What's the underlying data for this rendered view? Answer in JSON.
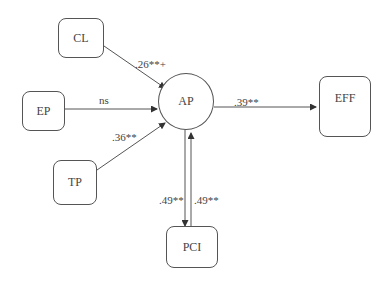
{
  "diagram": {
    "type": "path-model",
    "nodes": [
      {
        "id": "CL",
        "label": "CL",
        "shape": "rounded-rect"
      },
      {
        "id": "EP",
        "label": "EP",
        "shape": "rounded-rect"
      },
      {
        "id": "TP",
        "label": "TP",
        "shape": "rounded-rect"
      },
      {
        "id": "AP",
        "label": "AP",
        "shape": "circle"
      },
      {
        "id": "EFF",
        "label": "EFF",
        "shape": "rounded-rect"
      },
      {
        "id": "PCI",
        "label": "PCI",
        "shape": "rounded-rect"
      }
    ],
    "edges": [
      {
        "from": "CL",
        "to": "AP",
        "label": ".26**+"
      },
      {
        "from": "EP",
        "to": "AP",
        "label": "ns"
      },
      {
        "from": "TP",
        "to": "AP",
        "label": ".36**"
      },
      {
        "from": "AP",
        "to": "EFF",
        "label": ".39**"
      },
      {
        "from": "AP",
        "to": "PCI",
        "label": ".49**"
      },
      {
        "from": "PCI",
        "to": "AP",
        "label": ".49**"
      }
    ]
  }
}
